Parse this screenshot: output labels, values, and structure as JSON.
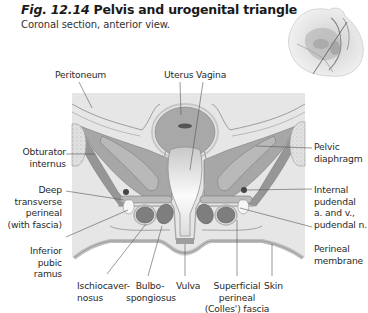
{
  "figure": {
    "number": "Fig. 12.14",
    "title": "Pelvis and urogenital triangle",
    "subtitle": "Coronal section, anterior view."
  },
  "thumbnail": {
    "description": "Orientation inset: sagittal pelvis with cut plane"
  },
  "labels": {
    "top": [
      "Peritoneum",
      "Uterus",
      "Vagina"
    ],
    "left": {
      "obturator_internus": [
        "Obturator",
        "internus"
      ],
      "deep_transverse_perineal": [
        "Deep",
        "transverse",
        "perineal",
        "(with fascia)"
      ],
      "inferior_pubic_ramus": [
        "Inferior",
        "pubic",
        "ramus"
      ]
    },
    "right": {
      "pelvic_diaphragm": [
        "Pelvic",
        "diaphragm"
      ],
      "internal_pudendal": [
        "Internal",
        "pudendal",
        "a. and v.,",
        "pudendal n."
      ],
      "perineal_membrane": [
        "Perineal",
        "membrane"
      ]
    },
    "bottom": {
      "ischiocavernosus": [
        "Ischiocaver-",
        "nosus"
      ],
      "bulbospongiosus": [
        "Bulbo-",
        "spongiosus"
      ],
      "vulva": [
        "Vulva"
      ],
      "superficial_perineal_fascia": [
        "Superficial",
        "perineal",
        "(Colles') fascia"
      ],
      "skin": [
        "Skin"
      ]
    }
  },
  "colors": {
    "panel_bg": "#e6e6e6",
    "muscle_dark": "#8f8f8f",
    "muscle_mid": "#a9a9a9",
    "fascia_light": "#d4d4d4",
    "bone": "#f2f2f2",
    "leader_line": "#555555"
  }
}
